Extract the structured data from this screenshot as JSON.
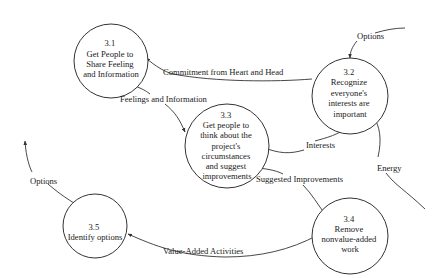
{
  "diagram": {
    "type": "data-flow-diagram",
    "colors": {
      "line": "#333333",
      "text": "#1a1a1a",
      "background": "#ffffff"
    },
    "processes": [
      {
        "id": "3.1",
        "lines": [
          "3.1",
          "Get People to",
          "Share Feeling",
          "and Information"
        ]
      },
      {
        "id": "3.2",
        "lines": [
          "3.2",
          "Recognize",
          "everyone's",
          "interests are",
          "important"
        ]
      },
      {
        "id": "3.3",
        "lines": [
          "3.3",
          "Get people to",
          "think about the",
          "project's",
          "circumstances",
          "and suggest",
          "improvements"
        ]
      },
      {
        "id": "3.4",
        "lines": [
          "3.4",
          "Remove",
          "nonvalue-added",
          "work"
        ]
      },
      {
        "id": "3.5",
        "lines": [
          "3.5",
          "Identify options"
        ]
      }
    ],
    "flows": [
      {
        "label": "Commitment from Heart and Head",
        "from": "3.2",
        "to": "3.1"
      },
      {
        "label": "Feelings and Information",
        "from": "3.1",
        "to": "3.3"
      },
      {
        "label": "Interests",
        "from": "3.2",
        "to": "3.3"
      },
      {
        "label": "Suggested Improvements",
        "from": "3.3",
        "to": "3.4"
      },
      {
        "label": "Value-Added Activities",
        "from": "3.4",
        "to": "3.5"
      },
      {
        "label": "Options",
        "from": "3.5",
        "to": "external",
        "position": "left"
      },
      {
        "label": "Options",
        "from": "external",
        "to": "3.2",
        "position": "top"
      },
      {
        "label": "Energy",
        "from": "external",
        "to": "3.2"
      }
    ]
  }
}
